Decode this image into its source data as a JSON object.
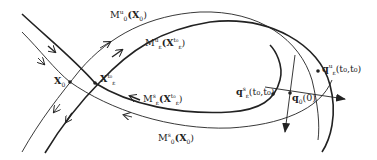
{
  "diagram": {
    "type": "phase-space invariant manifolds",
    "labels": {
      "m_u_0": {
        "main": "M",
        "sup": "u",
        "sub": "0",
        "arg": "(X",
        "argsub": "0",
        "close": ")"
      },
      "m_u_eps": {
        "main": "M",
        "sup": "u",
        "sub": "ε",
        "arg": "(X",
        "argsup": "t₀",
        "argsub": "ε",
        "close": ")"
      },
      "x0": {
        "main": "X",
        "sub": "0"
      },
      "x_eps": {
        "main": "X",
        "sup": "t₀",
        "sub": "ε"
      },
      "m_s_eps": {
        "main": "M",
        "sup": "s",
        "sub": "ε",
        "arg": "(X",
        "argsup": "t₀",
        "argsub": "ε",
        "close": ")"
      },
      "m_s_0": {
        "main": "M",
        "sup": "s",
        "sub": "0",
        "arg": "(X",
        "argsub": "0",
        "close": ")"
      },
      "q_s": {
        "main": "q",
        "sup": "s",
        "sub": "ε",
        "arg": "(t₀,t₀)"
      },
      "q0": {
        "main": "q",
        "sub": "0",
        "arg": "(0)"
      },
      "q_u": {
        "main": "q",
        "sup": "u",
        "sub": "ε",
        "arg": "(t₀,t₀)"
      }
    },
    "colors": {
      "stroke": "#222222",
      "background": "#ffffff"
    }
  }
}
